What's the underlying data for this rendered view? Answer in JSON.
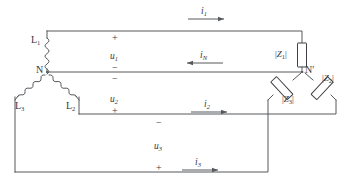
{
  "diagram": {
    "colors": {
      "wire": "#55585c",
      "impedance_outline": "#3c3f43",
      "text": "#35383c",
      "background": "#ffffff"
    },
    "source": {
      "type": "star-connected source",
      "neutral_label": "N",
      "phases": [
        {
          "name": "phase-l1",
          "label": "L",
          "sub": "1"
        },
        {
          "name": "phase-l2",
          "label": "L",
          "sub": "2"
        },
        {
          "name": "phase-l3",
          "label": "L",
          "sub": "3"
        }
      ]
    },
    "load": {
      "type": "star-connected load",
      "neutral_label": "N",
      "neutral_prime": "′",
      "impedances": [
        {
          "name": "impedance-z1",
          "open": "|",
          "symbol": "Z",
          "sub": "1",
          "close": "|"
        },
        {
          "name": "impedance-z2",
          "open": "|",
          "symbol": "Z",
          "sub": "2",
          "close": "|"
        },
        {
          "name": "impedance-z3",
          "open": "|",
          "symbol": "Z",
          "sub": "3",
          "close": "|"
        }
      ]
    },
    "voltages": [
      {
        "name": "voltage-u1",
        "symbol": "u",
        "sub": "1",
        "plus": "+",
        "minus": "−"
      },
      {
        "name": "voltage-u2",
        "symbol": "u",
        "sub": "2",
        "plus": "+",
        "minus": "−"
      },
      {
        "name": "voltage-u3",
        "symbol": "u",
        "sub": "3",
        "plus": "+",
        "minus": "−"
      }
    ],
    "currents": [
      {
        "name": "current-i1",
        "symbol": "i",
        "sub": "1",
        "direction": "right"
      },
      {
        "name": "current-in",
        "symbol": "i",
        "sub": "N",
        "direction": "left"
      },
      {
        "name": "current-i2",
        "symbol": "i",
        "sub": "2",
        "direction": "right"
      },
      {
        "name": "current-i3",
        "symbol": "i",
        "sub": "3",
        "direction": "right"
      }
    ]
  }
}
